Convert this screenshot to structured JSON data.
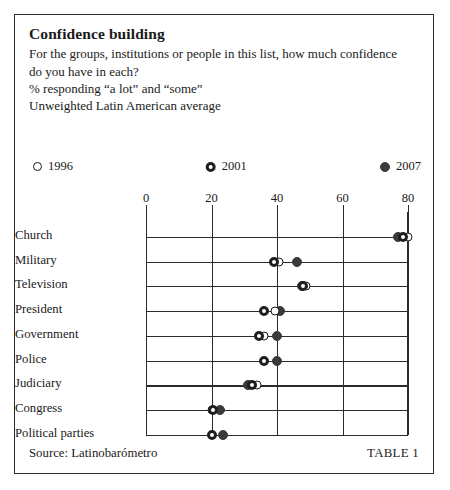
{
  "header": {
    "title": "Confidence building",
    "question_line1": "For the groups, institutions or people in this list, how much confidence",
    "question_line2": "do you have in each?",
    "measure": "% responding “a lot” and “some”",
    "basis": "Unweighted Latin American average"
  },
  "legend": [
    {
      "label": "1996",
      "marker": "hollow-circle-icon"
    },
    {
      "label": "2001",
      "marker": "donut-circle-icon"
    },
    {
      "label": "2007",
      "marker": "filled-circle-icon"
    }
  ],
  "footer": {
    "source": "Source: Latinobarómetro",
    "table_number": "TABLE 1"
  },
  "chart_data": {
    "type": "scatter",
    "title": "Confidence building",
    "subtitle": "For the groups, institutions or people in this list, how much confidence do you have in each?",
    "xlabel": "% responding “a lot” and “some”",
    "ylabel": "",
    "xlim": [
      0,
      80
    ],
    "xticks": [
      0,
      20,
      40,
      60,
      80
    ],
    "xtick_labels": [
      "0",
      "20",
      "40",
      "60",
      "80"
    ],
    "grid": "vertical",
    "legend_position": "top",
    "categories": [
      "Church",
      "Military",
      "Television",
      "President",
      "Government",
      "Police",
      "Judiciary",
      "Congress",
      "Political parties"
    ],
    "series": [
      {
        "name": "1996",
        "marker": "hollow-circle",
        "values": [
          80,
          40.5,
          49,
          39.5,
          36,
          36,
          34,
          20,
          20
        ]
      },
      {
        "name": "2001",
        "marker": "donut-circle",
        "values": [
          78.5,
          39,
          48,
          36,
          34.5,
          36,
          32.5,
          20.5,
          20
        ]
      },
      {
        "name": "2007",
        "marker": "filled-circle",
        "values": [
          77,
          46,
          47.5,
          41,
          40,
          40,
          31,
          22.5,
          23.5
        ]
      }
    ]
  }
}
